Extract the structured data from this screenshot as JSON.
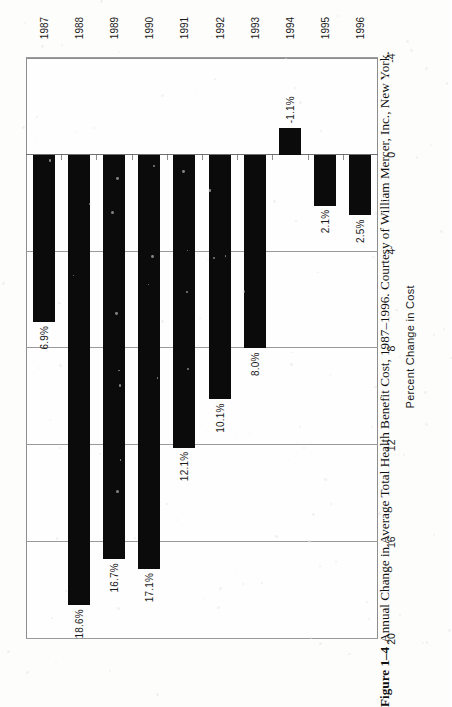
{
  "figure": {
    "caption_label": "Figure 1–4",
    "caption_text": "Annual Change in Average Total Health Benefit Cost, 1987–1996. Courtesy of William Mercer, Inc., New York.",
    "orientation": "rotated-90-ccw",
    "colors": {
      "bar": "#0b0b0b",
      "grid": "#9a9a9a",
      "frame": "#8d8d8d",
      "text": "#1a1a1a",
      "background": "#fdfdfc"
    }
  },
  "chart_data": {
    "type": "bar",
    "title": "",
    "subtitle": "",
    "orientation": "horizontal-bars-in-rotated-figure",
    "categories": [
      "1987",
      "1988",
      "1989",
      "1990",
      "1991",
      "1992",
      "1993",
      "1994",
      "1995",
      "1996"
    ],
    "values": [
      6.9,
      18.6,
      16.7,
      17.1,
      12.1,
      10.1,
      8.0,
      -1.1,
      2.1,
      2.5
    ],
    "data_labels": [
      "6.9%",
      "18.6%",
      "16.7%",
      "17.1%",
      "12.1%",
      "10.1%",
      "8.0%",
      "-1.1%",
      "2.1%",
      "2.5%"
    ],
    "xlabel": "",
    "ylabel": "Percent Change in Cost",
    "ylim": [
      -4,
      20
    ],
    "yticks": [
      20,
      16,
      12,
      8,
      4,
      0,
      -4
    ],
    "ytick_labels": [
      "20",
      "16",
      "12",
      "8",
      "4",
      "0",
      "-4"
    ],
    "grid": true,
    "legend": false,
    "legend_position": "none",
    "series": [
      {
        "name": "Annual Change in Average Total Health Benefit Cost",
        "values": [
          6.9,
          18.6,
          16.7,
          17.1,
          12.1,
          10.1,
          8.0,
          -1.1,
          2.1,
          2.5
        ]
      }
    ],
    "units": "percent"
  }
}
